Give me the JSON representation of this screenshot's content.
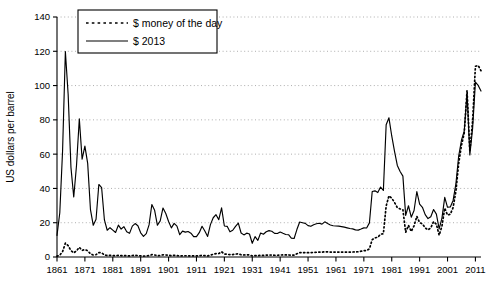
{
  "chart_data": {
    "type": "line",
    "title": "",
    "xlabel": "",
    "ylabel": "US dollars per barrel",
    "xlim": [
      1861,
      2013
    ],
    "ylim": [
      0,
      140
    ],
    "ytick_step": 20,
    "yticks": [
      0,
      20,
      40,
      60,
      80,
      100,
      120,
      140
    ],
    "xticks": [
      1861,
      1871,
      1881,
      1891,
      1901,
      1911,
      1921,
      1931,
      1941,
      1951,
      1961,
      1971,
      1981,
      1991,
      2001,
      2011
    ],
    "grid": true,
    "grid_style": "dotted-horizontal",
    "legend_position": "top-left-inside",
    "series": [
      {
        "name": "$ money of the day",
        "style": "dotted",
        "color": "#000000",
        "x": [
          1861,
          1862,
          1863,
          1864,
          1865,
          1866,
          1867,
          1868,
          1869,
          1870,
          1871,
          1872,
          1873,
          1874,
          1875,
          1876,
          1877,
          1878,
          1879,
          1880,
          1881,
          1882,
          1883,
          1884,
          1885,
          1886,
          1887,
          1888,
          1889,
          1890,
          1891,
          1892,
          1893,
          1894,
          1895,
          1896,
          1897,
          1898,
          1899,
          1900,
          1901,
          1902,
          1903,
          1904,
          1905,
          1906,
          1907,
          1908,
          1909,
          1910,
          1911,
          1912,
          1913,
          1914,
          1915,
          1916,
          1917,
          1918,
          1919,
          1920,
          1921,
          1922,
          1923,
          1924,
          1925,
          1926,
          1927,
          1928,
          1929,
          1930,
          1931,
          1932,
          1933,
          1934,
          1935,
          1936,
          1937,
          1938,
          1939,
          1940,
          1941,
          1942,
          1943,
          1944,
          1945,
          1946,
          1947,
          1948,
          1949,
          1950,
          1951,
          1952,
          1953,
          1954,
          1955,
          1956,
          1957,
          1958,
          1959,
          1960,
          1961,
          1962,
          1963,
          1964,
          1965,
          1966,
          1967,
          1968,
          1969,
          1970,
          1971,
          1972,
          1973,
          1974,
          1975,
          1976,
          1977,
          1978,
          1979,
          1980,
          1981,
          1982,
          1983,
          1984,
          1985,
          1986,
          1987,
          1988,
          1989,
          1990,
          1991,
          1992,
          1993,
          1994,
          1995,
          1996,
          1997,
          1998,
          1999,
          2000,
          2001,
          2002,
          2003,
          2004,
          2005,
          2006,
          2007,
          2008,
          2009,
          2010,
          2011,
          2012,
          2013
        ],
        "values": [
          0.49,
          1.05,
          3.15,
          8.06,
          6.59,
          3.74,
          2.41,
          3.63,
          5.64,
          3.86,
          4.34,
          3.64,
          1.83,
          1.17,
          1.35,
          2.56,
          2.42,
          1.19,
          0.86,
          0.95,
          0.86,
          0.78,
          1.0,
          0.84,
          0.88,
          0.71,
          0.67,
          0.88,
          0.94,
          0.87,
          0.67,
          0.56,
          0.64,
          0.84,
          1.36,
          1.18,
          0.79,
          0.91,
          1.29,
          1.19,
          0.96,
          0.8,
          0.94,
          0.86,
          0.62,
          0.73,
          0.72,
          0.72,
          0.7,
          0.61,
          0.61,
          0.74,
          0.95,
          0.81,
          0.64,
          1.1,
          1.56,
          1.98,
          2.01,
          3.07,
          1.73,
          1.61,
          1.34,
          1.43,
          1.68,
          1.88,
          1.3,
          1.17,
          1.27,
          1.19,
          0.65,
          0.87,
          0.67,
          1.0,
          0.97,
          1.09,
          1.18,
          1.13,
          1.02,
          1.02,
          1.14,
          1.19,
          1.2,
          1.21,
          1.05,
          1.12,
          1.9,
          2.6,
          2.54,
          2.51,
          2.53,
          2.53,
          2.68,
          2.78,
          2.82,
          2.79,
          3.09,
          3.01,
          2.9,
          2.88,
          2.89,
          2.9,
          2.89,
          2.88,
          2.86,
          2.88,
          2.92,
          2.94,
          3.09,
          3.39,
          3.7,
          3.8,
          4.75,
          10.11,
          11.16,
          11.51,
          13.3,
          13.6,
          29.75,
          35.69,
          34.32,
          31.8,
          28.78,
          28.07,
          27.53,
          14.43,
          18.44,
          14.92,
          18.23,
          23.73,
          20.0,
          19.32,
          16.97,
          15.82,
          17.02,
          20.67,
          19.09,
          12.72,
          17.97,
          28.5,
          24.44,
          24.99,
          28.85,
          38.26,
          54.52,
          65.14,
          72.39,
          97.26,
          61.67,
          79.5,
          111.26,
          111.67,
          108.66
        ]
      },
      {
        "name": "$ 2013",
        "style": "solid",
        "color": "#000000",
        "x": [
          1861,
          1862,
          1863,
          1864,
          1865,
          1866,
          1867,
          1868,
          1869,
          1870,
          1871,
          1872,
          1873,
          1874,
          1875,
          1876,
          1877,
          1878,
          1879,
          1880,
          1881,
          1882,
          1883,
          1884,
          1885,
          1886,
          1887,
          1888,
          1889,
          1890,
          1891,
          1892,
          1893,
          1894,
          1895,
          1896,
          1897,
          1898,
          1899,
          1900,
          1901,
          1902,
          1903,
          1904,
          1905,
          1906,
          1907,
          1908,
          1909,
          1910,
          1911,
          1912,
          1913,
          1914,
          1915,
          1916,
          1917,
          1918,
          1919,
          1920,
          1921,
          1922,
          1923,
          1924,
          1925,
          1926,
          1927,
          1928,
          1929,
          1930,
          1931,
          1932,
          1933,
          1934,
          1935,
          1936,
          1937,
          1938,
          1939,
          1940,
          1941,
          1942,
          1943,
          1944,
          1945,
          1946,
          1947,
          1948,
          1949,
          1950,
          1951,
          1952,
          1953,
          1954,
          1955,
          1956,
          1957,
          1958,
          1959,
          1960,
          1961,
          1962,
          1963,
          1964,
          1965,
          1966,
          1967,
          1968,
          1969,
          1970,
          1971,
          1972,
          1973,
          1974,
          1975,
          1976,
          1977,
          1978,
          1979,
          1980,
          1981,
          1982,
          1983,
          1984,
          1985,
          1986,
          1987,
          1988,
          1989,
          1990,
          1991,
          1992,
          1993,
          1994,
          1995,
          1996,
          1997,
          1998,
          1999,
          2000,
          2001,
          2002,
          2003,
          2004,
          2005,
          2006,
          2007,
          2008,
          2009,
          2010,
          2011,
          2012,
          2013
        ],
        "values": [
          12.6,
          25.8,
          62.0,
          119.9,
          94.8,
          52.3,
          35.0,
          53.5,
          80.6,
          57.1,
          64.7,
          54.6,
          27.6,
          18.5,
          22.0,
          42.3,
          40.4,
          21.6,
          15.6,
          17.1,
          15.7,
          14.3,
          18.6,
          16.3,
          17.7,
          14.7,
          13.8,
          18.0,
          19.5,
          18.2,
          14.1,
          12.0,
          13.6,
          18.7,
          30.6,
          27.2,
          18.5,
          21.1,
          28.6,
          25.4,
          20.7,
          17.0,
          19.6,
          18.0,
          13.0,
          15.1,
          14.5,
          14.9,
          13.9,
          11.9,
          11.9,
          14.2,
          17.9,
          15.2,
          12.0,
          18.9,
          22.9,
          24.7,
          21.8,
          28.7,
          18.1,
          17.9,
          14.7,
          15.6,
          17.9,
          19.8,
          14.0,
          12.9,
          13.9,
          13.4,
          8.0,
          11.9,
          9.7,
          14.0,
          13.3,
          14.7,
          15.4,
          15.0,
          13.8,
          13.7,
          14.6,
          13.8,
          13.1,
          13.0,
          11.0,
          10.8,
          16.0,
          20.4,
          20.0,
          19.6,
          18.3,
          17.9,
          18.8,
          19.4,
          19.7,
          19.2,
          20.5,
          19.5,
          18.7,
          18.2,
          18.1,
          18.0,
          17.7,
          17.4,
          17.0,
          16.6,
          16.4,
          15.8,
          15.7,
          16.3,
          17.0,
          16.9,
          19.9,
          38.2,
          38.6,
          37.6,
          40.8,
          38.8,
          77.1,
          81.2,
          70.6,
          61.6,
          53.4,
          49.9,
          47.2,
          24.3,
          29.9,
          23.2,
          27.1,
          38.2,
          30.9,
          29.0,
          24.7,
          22.4,
          23.5,
          27.7,
          25.0,
          16.4,
          22.7,
          34.8,
          29.0,
          29.2,
          33.0,
          42.6,
          58.9,
          68.1,
          73.5,
          95.4,
          59.5,
          75.2,
          102.0,
          100.1,
          96.8
        ]
      }
    ]
  },
  "axis": {
    "y_title": "US dollars per barrel",
    "y_tick_labels": [
      "0",
      "20",
      "40",
      "60",
      "80",
      "100",
      "120",
      "140"
    ],
    "x_tick_labels": [
      "1861",
      "1871",
      "1881",
      "1891",
      "1901",
      "1911",
      "1921",
      "1931",
      "1941",
      "1951",
      "1961",
      "1971",
      "1981",
      "1991",
      "2001",
      "2011"
    ]
  },
  "legend": {
    "entries": [
      {
        "label": "$ money of the day",
        "style": "dotted"
      },
      {
        "label": "$ 2013",
        "style": "solid"
      }
    ]
  },
  "colors": {
    "line": "#000000",
    "grid": "#999999",
    "axis": "#000000",
    "background": "#ffffff"
  }
}
